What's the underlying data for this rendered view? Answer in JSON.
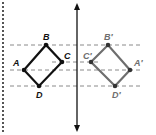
{
  "diagram": {
    "colors": {
      "original": "#111111",
      "image": "#6e6e6e",
      "guide": "#8a8a8a",
      "mirror": "#111111",
      "border": "#555555"
    },
    "original_labels": {
      "A": "A",
      "B": "B",
      "C": "C",
      "D": "D"
    },
    "image_labels": {
      "A": "A′",
      "B": "B′",
      "C": "C′",
      "D": "D′"
    }
  }
}
